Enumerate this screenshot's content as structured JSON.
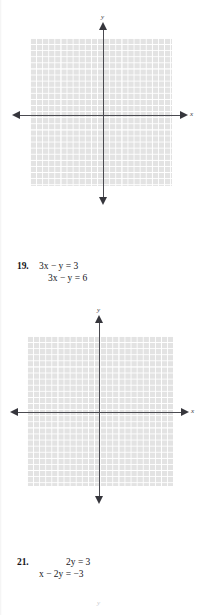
{
  "page": {
    "background_color": "#ffffff",
    "grid_fill_color": "#e3e3e3",
    "grid_line_color": "#ffffff",
    "axis_color": "#4a4a50",
    "text_color": "#15151a"
  },
  "graphs": [
    {
      "id": "graph-top",
      "x_axis_label": "x",
      "y_axis_label": "y",
      "columns": 23,
      "rows": 24
    },
    {
      "id": "graph-middle",
      "x_axis_label": "x",
      "y_axis_label": "y",
      "columns": 24,
      "rows": 25
    },
    {
      "id": "graph-bottom-partial",
      "y_axis_label": "y"
    }
  ],
  "problems": [
    {
      "number": "19.",
      "equations": [
        "3x − y = 3",
        "3x − y = 6"
      ]
    },
    {
      "number": "21.",
      "equations": [
        "2y = 3",
        "x − 2y = −3"
      ]
    }
  ]
}
